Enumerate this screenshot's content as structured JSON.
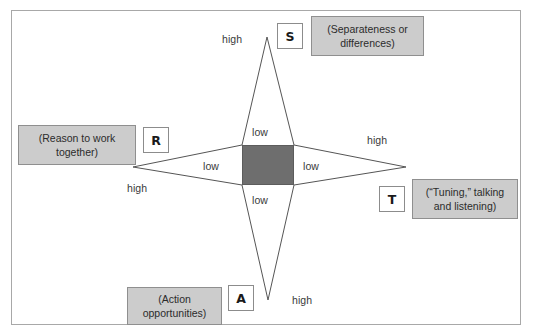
{
  "diagram": {
    "type": "star-diamond-quadrant",
    "background": "#ffffff",
    "frame_border_color": "#a8a8a8",
    "center": {
      "name": "center-square",
      "fill": "#6e6e6e",
      "meaning": "low on all four dimensions"
    },
    "axes": [
      {
        "id": "S",
        "letter": "S",
        "caption": "(Separateness or differences)",
        "direction": "up",
        "high_label": "high",
        "low_label": "low"
      },
      {
        "id": "R",
        "letter": "R",
        "caption": "(Reason to work together)",
        "direction": "left",
        "high_label": "high",
        "low_label": "low"
      },
      {
        "id": "T",
        "letter": "T",
        "caption": "(“Tuning,” talking and listening)",
        "direction": "right",
        "high_label": "high",
        "low_label": "low"
      },
      {
        "id": "A",
        "letter": "A",
        "caption": "(Action opportunities)",
        "direction": "down",
        "high_label": "high",
        "low_label": "low"
      }
    ],
    "labels": {
      "high_top": "high",
      "high_left": "high",
      "high_right": "high",
      "high_bottom": "high",
      "low_top": "low",
      "low_left": "low",
      "low_right": "low",
      "low_bottom": "low"
    },
    "captions": {
      "s_line1": "(Separateness or",
      "s_line2": "differences)",
      "r_line1": "(Reason to work",
      "r_line2": "together)",
      "t_line1": "(“Tuning,” talking",
      "t_line2": "and listening)",
      "a_line1": "(Action",
      "a_line2": "opportunities)"
    },
    "letters": {
      "s": "S",
      "r": "R",
      "t": "T",
      "a": "A"
    },
    "colors": {
      "center_fill": "#6e6e6e",
      "caption_fill": "#cccccc",
      "caption_border": "#8f8f8f",
      "letter_box_border": "#8c8c8c",
      "line_color": "#555555"
    }
  }
}
